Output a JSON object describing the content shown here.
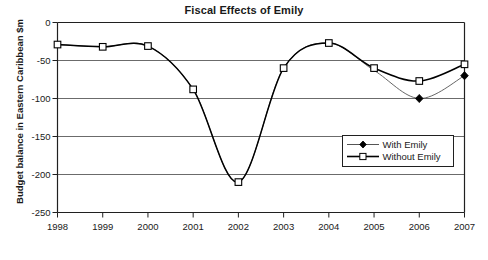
{
  "chart_data": {
    "type": "line",
    "title": "Fiscal Effects of Emily",
    "xlabel": "Year",
    "ylabel": "Budget balance in Eastern Caribbean $m",
    "categories": [
      "1998",
      "1999",
      "2000",
      "2001",
      "2002",
      "2003",
      "2004",
      "2005",
      "2006",
      "2007"
    ],
    "x": [
      1998,
      1999,
      2000,
      2001,
      2002,
      2003,
      2004,
      2005,
      2006,
      2007
    ],
    "ylim": [
      -250,
      0
    ],
    "xlim": [
      1998,
      2007
    ],
    "yticks": [
      0,
      -50,
      -100,
      -150,
      -200,
      -250
    ],
    "ytick_labels": [
      "0",
      "-50",
      "-100",
      "-150",
      "-200",
      "-250"
    ],
    "grid": true,
    "grid_axis": "y",
    "legend_position": "lower right inside plot area",
    "smoothing": "spline",
    "series": [
      {
        "name": "With Emily",
        "marker": "filled-diamond",
        "marker_color": "#000000",
        "line_color": "#555555",
        "line_width": 0.9,
        "values": [
          -29,
          -32,
          -31,
          -88,
          -210,
          -60,
          -27,
          -63,
          -100,
          -70
        ],
        "visible_markers": [
          "2006",
          "2007"
        ]
      },
      {
        "name": "Without Emily",
        "marker": "open-square",
        "marker_color": "#ffffff",
        "marker_edge_color": "#000000",
        "line_color": "#000000",
        "line_width": 1.5,
        "values": [
          -29,
          -32,
          -31,
          -88,
          -210,
          -60,
          -27,
          -60,
          -77,
          -55
        ],
        "visible_markers": [
          "1998",
          "1999",
          "2000",
          "2001",
          "2002",
          "2003",
          "2004",
          "2005",
          "2006",
          "2007"
        ]
      }
    ]
  },
  "legend": {
    "entries": [
      {
        "label": "With Emily"
      },
      {
        "label": "Without Emily"
      }
    ]
  },
  "colors": {
    "axis": "#202020",
    "grid": "#6b6b6b",
    "text": "#1a1a1a",
    "series_without": "#000000",
    "series_with": "#555555",
    "background": "#ffffff"
  }
}
